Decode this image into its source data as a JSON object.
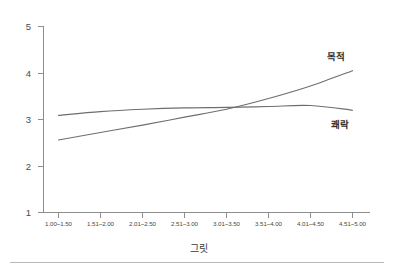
{
  "chart_data": {
    "type": "line",
    "title": "",
    "subtitle": "",
    "xlabel": "그릿",
    "ylabel": "",
    "categories": [
      "1.00~1.50",
      "1.51~2.00",
      "2.01~2.50",
      "2.51~3.00",
      "3.01~3.50",
      "3.51~4.00",
      "4.01~4.50",
      "4.51~5.00"
    ],
    "series": [
      {
        "name": "목적",
        "values": [
          2.56,
          2.72,
          2.88,
          3.05,
          3.22,
          3.45,
          3.72,
          4.05
        ]
      },
      {
        "name": "쾌락",
        "values": [
          3.09,
          3.17,
          3.22,
          3.25,
          3.26,
          3.28,
          3.3,
          3.2
        ]
      }
    ],
    "ylim": [
      1,
      5
    ],
    "yticks": [
      "1",
      "2",
      "3",
      "4",
      "5"
    ],
    "grid": false,
    "legend_position": "inline-right",
    "annotations": [
      {
        "text": "목적",
        "series": "목적",
        "position": "upper-right"
      },
      {
        "text": "쾌락",
        "series": "쾌락",
        "position": "lower-right"
      }
    ],
    "line_color": "#6e6e6e",
    "axis_color": "#8d8d8d"
  },
  "axis": {
    "y_tick_labels": [
      "5",
      "4",
      "3",
      "2",
      "1"
    ],
    "x_title": "그릿"
  },
  "labels": {
    "series_purpose": "목적",
    "series_pleasure": "쾌락"
  }
}
